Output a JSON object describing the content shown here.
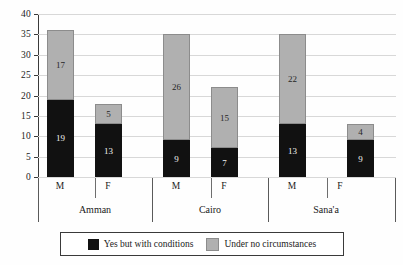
{
  "chart_data": {
    "type": "bar",
    "subtype": "stacked-vertical",
    "title": "",
    "xlabel": "",
    "ylabel": "",
    "ylim": [
      0,
      40
    ],
    "yticks": [
      0,
      5,
      10,
      15,
      20,
      25,
      30,
      35,
      40
    ],
    "grid": true,
    "legend_position": "bottom",
    "group_labels": [
      "Amman",
      "Cairo",
      "Sana'a"
    ],
    "categories": [
      "M",
      "F",
      "M",
      "F",
      "M",
      "F"
    ],
    "series": [
      {
        "name": "Yes but with conditions",
        "color": "#111111",
        "values": [
          19,
          13,
          9,
          7,
          13,
          9
        ]
      },
      {
        "name": "Under no circumstances",
        "color": "#b0b0b0",
        "values": [
          17,
          5,
          26,
          15,
          22,
          4
        ]
      }
    ],
    "totals": [
      36,
      18,
      35,
      22,
      35,
      13
    ]
  },
  "axis": {
    "y_tick_labels": [
      "40",
      "35",
      "30",
      "25",
      "20",
      "15",
      "10",
      "5",
      "0"
    ]
  },
  "groups": [
    {
      "label": "Amman",
      "sub": [
        "M",
        "F"
      ]
    },
    {
      "label": "Cairo",
      "sub": [
        "M",
        "F"
      ]
    },
    {
      "label": "Sana'a",
      "sub": [
        "M",
        "F"
      ]
    }
  ],
  "legend": {
    "items": [
      {
        "label": "Yes but with conditions",
        "color": "#111111"
      },
      {
        "label": "Under no circumstances",
        "color": "#b0b0b0"
      }
    ]
  },
  "bar_labels": {
    "amman_m_dark": "19",
    "amman_m_light": "17",
    "amman_f_dark": "13",
    "amman_f_light": "5",
    "cairo_m_dark": "9",
    "cairo_m_light": "26",
    "cairo_f_dark": "7",
    "cairo_f_light": "15",
    "sanaa_m_dark": "13",
    "sanaa_m_light": "22",
    "sanaa_f_dark": "9",
    "sanaa_f_light": "4"
  }
}
